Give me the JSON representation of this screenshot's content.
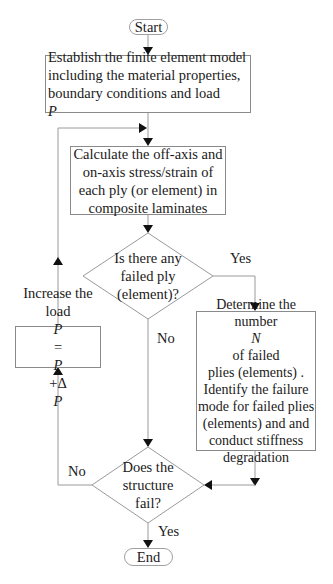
{
  "flowchart": {
    "start": "Start",
    "end": "End",
    "establish_model": [
      "Establish the finite element model",
      "including the material properties,",
      "boundary conditions and load "
    ],
    "establish_model_var": "P",
    "calculate_stress": [
      "Calculate the off-axis and",
      "on-axis stress/strain of",
      "each ply (or element) in",
      "composite laminates"
    ],
    "decision_failed_ply": [
      "Is there any",
      "failed ply",
      "(element)?"
    ],
    "determine_failure": {
      "line1": "Determine the",
      "line2_pre": "number ",
      "line2_var": "N",
      "line2_post": " of failed",
      "line3": "plies (elements) .",
      "line4": "Identify the failure",
      "line5": "mode for failed plies",
      "line6": "(elements) and and",
      "line7": "conduct stiffness",
      "line8": "degradation"
    },
    "increase_load": {
      "line1": "Increase the",
      "line2_pre": "load ",
      "line2_formula_a": "P",
      "line2_eq": "=",
      "line2_formula_b": "P",
      "line2_plus": "+Δ",
      "line2_formula_c": "P"
    },
    "decision_structure_fail": [
      "Does the",
      "structure",
      "fail?"
    ],
    "labels": {
      "yes_failed_ply": "Yes",
      "no_failed_ply": "No",
      "no_structure": "No",
      "yes_structure": "Yes"
    }
  },
  "colors": {
    "line": "#8a8a8a",
    "arrow": "#111111",
    "text": "#1a1a1a"
  }
}
